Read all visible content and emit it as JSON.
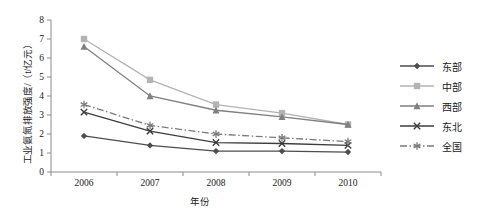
{
  "chart_data": {
    "type": "line",
    "title": "",
    "xlabel": "年份",
    "ylabel": "工业氨氮排放强度/（t/亿元）",
    "categories": [
      "2006",
      "2007",
      "2008",
      "2009",
      "2010"
    ],
    "x": [
      2006,
      2007,
      2008,
      2009,
      2010
    ],
    "ylim": [
      0,
      8
    ],
    "yticks": [
      "0",
      "1",
      "2",
      "3",
      "4",
      "5",
      "6",
      "7",
      "8"
    ],
    "ytick_values": [
      0,
      1,
      2,
      3,
      4,
      5,
      6,
      7,
      8
    ],
    "grid": false,
    "legend_position": "right",
    "series": [
      {
        "name": "东部",
        "values": [
          1.9,
          1.4,
          1.1,
          1.1,
          1.05
        ],
        "color": "#4d4d4d",
        "marker": "diamond",
        "dash": "solid"
      },
      {
        "name": "中部",
        "values": [
          7.0,
          4.85,
          3.55,
          3.1,
          2.5
        ],
        "color": "#b3b3b3",
        "marker": "square",
        "dash": "solid"
      },
      {
        "name": "西部",
        "values": [
          6.6,
          4.0,
          3.25,
          2.9,
          2.5
        ],
        "color": "#808080",
        "marker": "triangle",
        "dash": "solid"
      },
      {
        "name": "东北",
        "values": [
          3.15,
          2.15,
          1.55,
          1.5,
          1.4
        ],
        "color": "#3d3d3d",
        "marker": "x",
        "dash": "solid"
      },
      {
        "name": "全国",
        "values": [
          3.55,
          2.45,
          2.0,
          1.8,
          1.6
        ],
        "color": "#7a7a7a",
        "marker": "asterisk",
        "dash": "dashdot"
      }
    ]
  },
  "axis": {
    "y_title": "工业氨氮排放强度/（t/亿元）",
    "x_title": "年份"
  },
  "legend": {
    "items": [
      {
        "label": "东部"
      },
      {
        "label": "中部"
      },
      {
        "label": "西部"
      },
      {
        "label": "东北"
      },
      {
        "label": "全国"
      }
    ]
  }
}
